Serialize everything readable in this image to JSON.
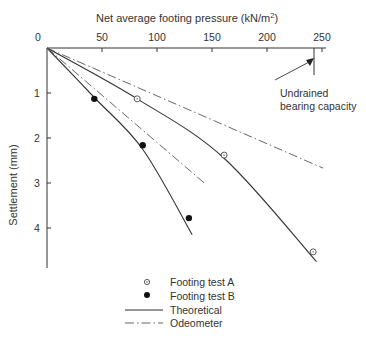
{
  "chart_data": {
    "type": "line",
    "title": "",
    "xlabel": "Net average footing pressure (kN/m²)",
    "xlabel_main": "Net average footing pressure (kN/m",
    "xlabel_sup": "2",
    "xlabel_close": ")",
    "ylabel": "Settlement (mm)",
    "x_axis_position": "top",
    "y_inverted": true,
    "xlim": [
      0,
      255
    ],
    "ylim": [
      0,
      5
    ],
    "x_ticks": [
      0,
      50,
      100,
      150,
      200,
      250
    ],
    "y_ticks": [
      1,
      2,
      3,
      4
    ],
    "grid": false,
    "series": [
      {
        "name": "Footing test A",
        "kind": "scatter",
        "marker": "open-circle-dot",
        "points": [
          [
            82,
            1.13
          ],
          [
            161,
            2.38
          ],
          [
            242,
            4.53
          ]
        ]
      },
      {
        "name": "Footing test B",
        "kind": "scatter",
        "marker": "filled-circle",
        "points": [
          [
            43,
            1.13
          ],
          [
            87,
            2.16
          ],
          [
            129,
            3.78
          ]
        ]
      },
      {
        "name": "Theoretical",
        "kind": "line",
        "style": "solid",
        "curves": [
          {
            "for": "A",
            "points": [
              [
                0,
                0
              ],
              [
                82,
                1.13
              ],
              [
                161,
                2.45
              ],
              [
                245,
                4.75
              ]
            ]
          },
          {
            "for": "B",
            "points": [
              [
                0,
                0
              ],
              [
                43,
                1.1
              ],
              [
                87,
                2.25
              ],
              [
                132,
                4.15
              ]
            ]
          }
        ]
      },
      {
        "name": "Odeometer",
        "kind": "line",
        "style": "dash-dot",
        "curves": [
          {
            "for": "A",
            "points": [
              [
                0,
                0
              ],
              [
                251,
                2.67
              ]
            ]
          },
          {
            "for": "B",
            "points": [
              [
                0,
                0
              ],
              [
                143,
                3.0
              ]
            ]
          }
        ]
      }
    ],
    "annotations": [
      {
        "text_line1": "Undrained",
        "text_line2": "bearing capacity",
        "x": 243,
        "y_range": [
          0,
          0.58
        ]
      }
    ],
    "legend": {
      "position": "bottom-center",
      "entries": [
        "Footing test A",
        "Footing test B",
        "Theoretical",
        "Odeometer"
      ]
    }
  }
}
